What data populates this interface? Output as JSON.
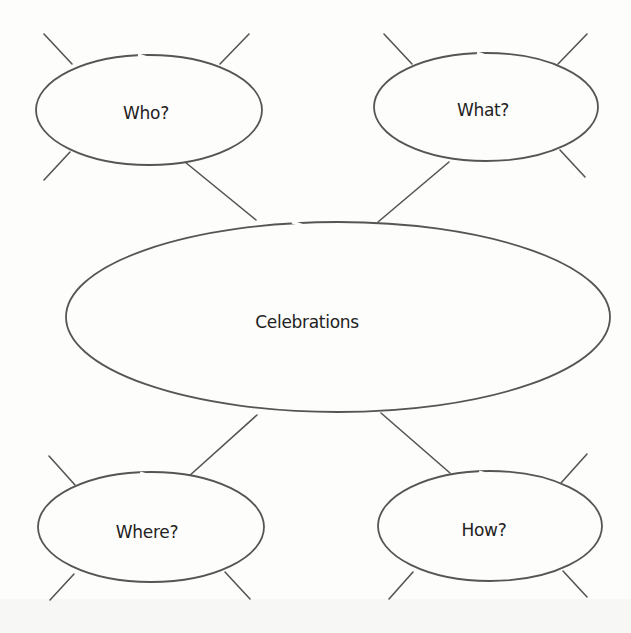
{
  "diagram": {
    "type": "spider-map",
    "center": {
      "label": "Celebrations"
    },
    "nodes": [
      {
        "id": "who",
        "label": "Who?"
      },
      {
        "id": "what",
        "label": "What?"
      },
      {
        "id": "where",
        "label": "Where?"
      },
      {
        "id": "how",
        "label": "How?"
      }
    ],
    "colors": {
      "line": "#555555",
      "text": "#222222",
      "background": "#fdfdfc"
    }
  }
}
